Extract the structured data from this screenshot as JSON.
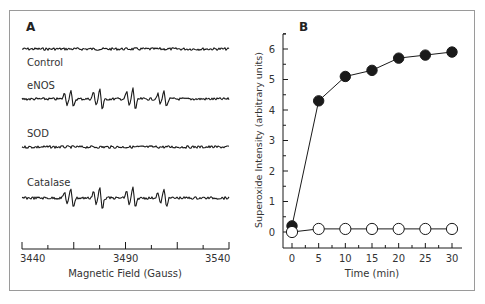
{
  "figure": {
    "frame_color": "#9a9a9a",
    "line_color": "#1a1a1a"
  },
  "chart_data": [
    {
      "panel": "A",
      "type": "line",
      "title": "",
      "xlabel": "Magnetic Field (Gauss)",
      "ylabel": "",
      "xlim": [
        3440,
        3540
      ],
      "x_ticks": [
        3440,
        3465,
        3490,
        3515,
        3540
      ],
      "x_tick_labels": [
        "3440",
        "3490",
        "3540"
      ],
      "x_minor_step": 12.5,
      "grid": false,
      "traces": [
        {
          "name": "Control",
          "signal": "noise-only",
          "label_y": 62,
          "baseline_y": 49
        },
        {
          "name": "eNOS",
          "signal": "DMPO-OOH quartet",
          "label_y": 85,
          "baseline_y": 99
        },
        {
          "name": "SOD",
          "signal": "noise-only",
          "label_y": 133,
          "baseline_y": 147
        },
        {
          "name": "Catalase",
          "signal": "DMPO-OOH quartet",
          "label_y": 102,
          "baseline_y": 198
        }
      ],
      "peak_positions_gauss": [
        3463,
        3477,
        3493,
        3508
      ]
    },
    {
      "panel": "B",
      "type": "line",
      "title": "",
      "xlabel": "Time (min)",
      "ylabel": "Superoxide Intensity (arbitrary units)",
      "xlim": [
        -2,
        32
      ],
      "ylim": [
        -0.5,
        6.5
      ],
      "x": [
        0,
        5,
        10,
        15,
        20,
        25,
        30
      ],
      "x_tick_labels": [
        "0",
        "5",
        "10",
        "15",
        "20",
        "25",
        "30"
      ],
      "y_ticks": [
        0,
        1,
        2,
        3,
        4,
        5,
        6
      ],
      "y_tick_labels": [
        "0",
        "1",
        "2",
        "3",
        "4",
        "5",
        "6"
      ],
      "grid": false,
      "legend": "none",
      "series": [
        {
          "name": "eNOS (filled circles)",
          "marker": "filled-circle",
          "values": [
            0.2,
            4.3,
            5.1,
            5.3,
            5.7,
            5.8,
            5.9
          ]
        },
        {
          "name": "Control (open circles)",
          "marker": "open-circle",
          "values": [
            0.0,
            0.1,
            0.1,
            0.1,
            0.1,
            0.1,
            0.1
          ]
        }
      ]
    }
  ],
  "labels": {
    "panel_a": "A",
    "panel_b": "B",
    "trace_control": "Control",
    "trace_enos": "eNOS",
    "trace_sod": "SOD",
    "trace_catalase": "Catalase",
    "a_xlabel": "Magnetic Field (Gauss)",
    "a_tick_0": "3440",
    "a_tick_1": "3490",
    "a_tick_2": "3540",
    "b_xlabel": "Time (min)",
    "b_ylabel": "Superoxide Intensity (arbitrary units)"
  }
}
